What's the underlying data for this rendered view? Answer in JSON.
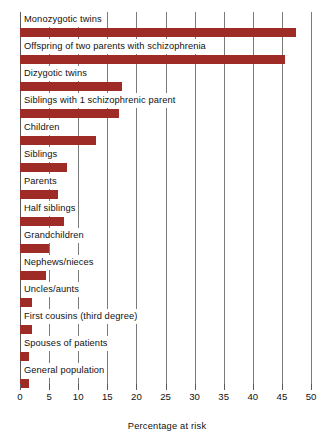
{
  "chart_data": {
    "type": "bar",
    "orientation": "horizontal",
    "title": "",
    "xlabel": "Percentage at risk",
    "ylabel": "",
    "xlim": [
      0,
      50
    ],
    "xticks": [
      0,
      5,
      10,
      15,
      20,
      25,
      30,
      35,
      40,
      45,
      50
    ],
    "xtick_labels": [
      "0",
      "5",
      "10",
      "15",
      "20",
      "25",
      "30",
      "35",
      "40",
      "45",
      "50"
    ],
    "grid": true,
    "legend": null,
    "bar_color": "#9e2b26",
    "categories": [
      "Monozygotic twins",
      "Offspring of two parents with schizophrenia",
      "Dizygotic twins",
      "Siblings with 1 schizophrenic parent",
      "Children",
      "Siblings",
      "Parents",
      "Half siblings",
      "Grandchildren",
      "Nephews/nieces",
      "Uncles/aunts",
      "First cousins (third degree)",
      "Spouses of patients",
      "General population"
    ],
    "values": [
      47.5,
      45.5,
      17.5,
      17,
      13,
      8,
      6.5,
      7.5,
      5,
      4.5,
      2,
      2,
      1.5,
      1.5
    ]
  }
}
